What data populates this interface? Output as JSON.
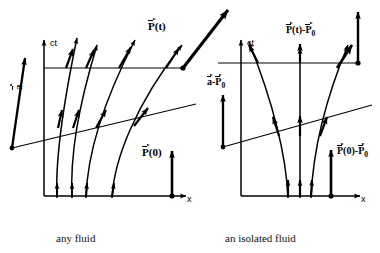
{
  "figure": {
    "title_domain": "spacetime-worldline-diagram",
    "stroke_color": "#000000",
    "background": "#ffffff"
  },
  "panels": [
    {
      "id": "any-fluid",
      "caption": "any fluid",
      "axes": {
        "vertical_label": "ct",
        "horizontal_label": "x"
      },
      "vectors": [
        {
          "name": "a-vector",
          "symbol": "a",
          "minus": "",
          "arg": ""
        },
        {
          "name": "P-of-t",
          "symbol": "P",
          "arg": "(t)"
        },
        {
          "name": "P-of-0",
          "symbol": "P",
          "arg": "(0)"
        }
      ],
      "worldline_count": 4,
      "tick_arrow_count": 4
    },
    {
      "id": "isolated-fluid",
      "caption": "an isolated fluid",
      "axes": {
        "vertical_label": "ct",
        "horizontal_label": "x"
      },
      "vectors": [
        {
          "name": "a-minus-P0",
          "symbol": "a",
          "op": "-",
          "symbol2": "P",
          "sub2": "0"
        },
        {
          "name": "P-of-t-minus-P0",
          "symbol": "P",
          "arg": "(t)",
          "op": "-",
          "symbol2": "P",
          "sub2": "0"
        },
        {
          "name": "P-of-0-minus-P0",
          "symbol": "P",
          "arg": "(0)",
          "op": "-",
          "symbol2": "P",
          "sub2": "0"
        }
      ],
      "worldline_count": 3,
      "tick_arrow_count": 3
    }
  ],
  "labels": {
    "ct": "ct",
    "x": "x",
    "a": "a",
    "P": "P",
    "t_arg": "(t)",
    "zero_arg": "(0)",
    "minus": "-",
    "sub_zero": "0",
    "caption_left": "any fluid",
    "caption_right": "an isolated fluid"
  }
}
